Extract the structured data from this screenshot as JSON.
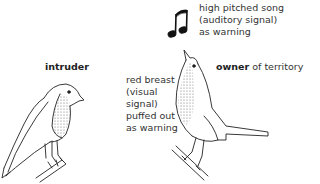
{
  "diagram": {
    "song_label": [
      "high pitched song",
      "(auditory signal)",
      "as warning"
    ],
    "intruder_label": "intruder",
    "owner_label_bold": "owner",
    "owner_label_rest": " of territory",
    "breast_label": [
      "red breast",
      "(visual",
      "signal)",
      "puffed out",
      "as warning"
    ]
  },
  "icons": [
    "music-note-icon"
  ],
  "colors": {
    "line": "#222222",
    "stipple": "#888888",
    "background": "#ffffff"
  }
}
